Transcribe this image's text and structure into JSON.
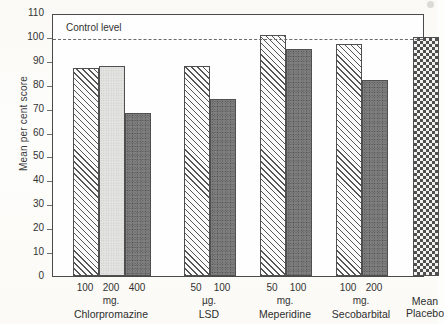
{
  "chart_data": {
    "type": "bar",
    "title": "",
    "xlabel": "",
    "ylabel": "Mean per cent score",
    "ylim": [
      0,
      110
    ],
    "ytick_labels": [
      "110",
      "100",
      "90",
      "80",
      "70",
      "60",
      "50",
      "40",
      "30",
      "20",
      "10",
      "0"
    ],
    "ytick_values": [
      110,
      100,
      90,
      80,
      70,
      60,
      50,
      40,
      30,
      20,
      10,
      0
    ],
    "grid": false,
    "legend": "none",
    "annotations": [
      {
        "name": "control-level",
        "label": "Control level",
        "value": 100,
        "style": "dashed-horizontal-line"
      }
    ],
    "groups": [
      {
        "name": "Chlorpromazine",
        "unit": "mg.",
        "doses": [
          "100",
          "200",
          "400"
        ],
        "values": [
          87,
          88,
          68
        ],
        "patterns": [
          "hatch",
          "solid-light",
          "stipple"
        ]
      },
      {
        "name": "LSD",
        "unit": "µg.",
        "doses": [
          "50",
          "100"
        ],
        "values": [
          88,
          74
        ],
        "patterns": [
          "hatch",
          "stipple"
        ]
      },
      {
        "name": "Meperidine",
        "unit": "mg.",
        "doses": [
          "50",
          "100"
        ],
        "values": [
          101,
          95
        ],
        "patterns": [
          "hatch",
          "stipple"
        ]
      },
      {
        "name": "Secobarbital",
        "unit": "mg.",
        "doses": [
          "100",
          "200"
        ],
        "values": [
          97,
          82
        ],
        "patterns": [
          "hatch",
          "stipple"
        ]
      },
      {
        "name": "Mean Placebo",
        "name_line1": "Mean",
        "name_line2": "Placebo",
        "unit": "",
        "doses": [
          ""
        ],
        "values": [
          100
        ],
        "patterns": [
          "checker"
        ]
      }
    ],
    "colors": {
      "axis": "#4a4a4a",
      "text": "#2e2e2e",
      "control_line": "#6a6a6a",
      "bar_outline": "#4f4f4f",
      "background": "#fdfdfb"
    }
  }
}
